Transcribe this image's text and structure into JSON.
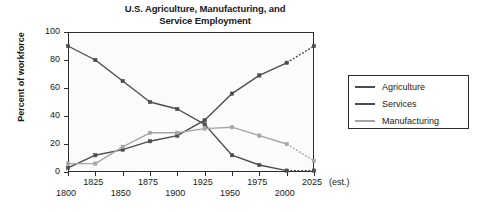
{
  "chart_data": {
    "type": "line",
    "title": "U.S. Agriculture, Manufacturing, and Service Employment",
    "title_line1": "U.S. Agriculture, Manufacturing, and",
    "title_line2": "Service Employment",
    "xlabel": "",
    "ylabel": "Percent of workforce",
    "ylim": [
      0,
      100
    ],
    "yticks": [
      0,
      20,
      40,
      60,
      80,
      100
    ],
    "ytick_labels": [
      "0",
      "20",
      "40",
      "60",
      "80",
      "100"
    ],
    "xlim": [
      1800,
      2025
    ],
    "xticks": [
      1800,
      1825,
      1850,
      1875,
      1900,
      1925,
      1950,
      1975,
      2000,
      2025
    ],
    "xtick_labels": [
      "1800",
      "1825",
      "1850",
      "1875",
      "1900",
      "1925",
      "1950",
      "1975",
      "2000",
      "2025"
    ],
    "xtick_suffix": "(est.)",
    "grid": false,
    "legend_position": "right",
    "x": [
      1800,
      1825,
      1850,
      1875,
      1900,
      1925,
      1950,
      1975,
      2000,
      2025
    ],
    "series": [
      {
        "name": "Agriculture",
        "color": "#4d4d4d",
        "values": [
          90,
          80,
          65,
          50,
          45,
          34,
          12,
          5,
          1,
          1
        ],
        "dashed_from": 2000
      },
      {
        "name": "Services",
        "color": "#4d4d4d",
        "values": [
          3,
          12,
          16,
          22,
          26,
          37,
          56,
          69,
          78,
          90
        ],
        "dashed_from": 2000
      },
      {
        "name": "Manufacturing",
        "color": "#a6a6a6",
        "values": [
          6,
          6,
          18,
          28,
          28,
          31,
          32,
          26,
          20,
          8
        ],
        "dashed_from": 2000
      }
    ]
  },
  "legend": {
    "items": [
      {
        "label": "Agriculture"
      },
      {
        "label": "Services"
      },
      {
        "label": "Manufacturing"
      }
    ]
  },
  "colors": {
    "axis": "#2b2b2b",
    "plot_background": "#fbfbfb",
    "agriculture": "#4d4d4d",
    "services": "#4d4d4d",
    "manufacturing": "#a6a6a6",
    "text": "#1a1a1a"
  }
}
